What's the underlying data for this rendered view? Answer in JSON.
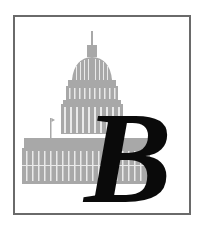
{
  "emblem": {
    "letter": "B",
    "illustration": "capitol-building",
    "colors": {
      "frame": "#6a6a6a",
      "illustration": "#a8a8a8",
      "letter": "#0a0a0a",
      "background": "#ffffff"
    }
  }
}
